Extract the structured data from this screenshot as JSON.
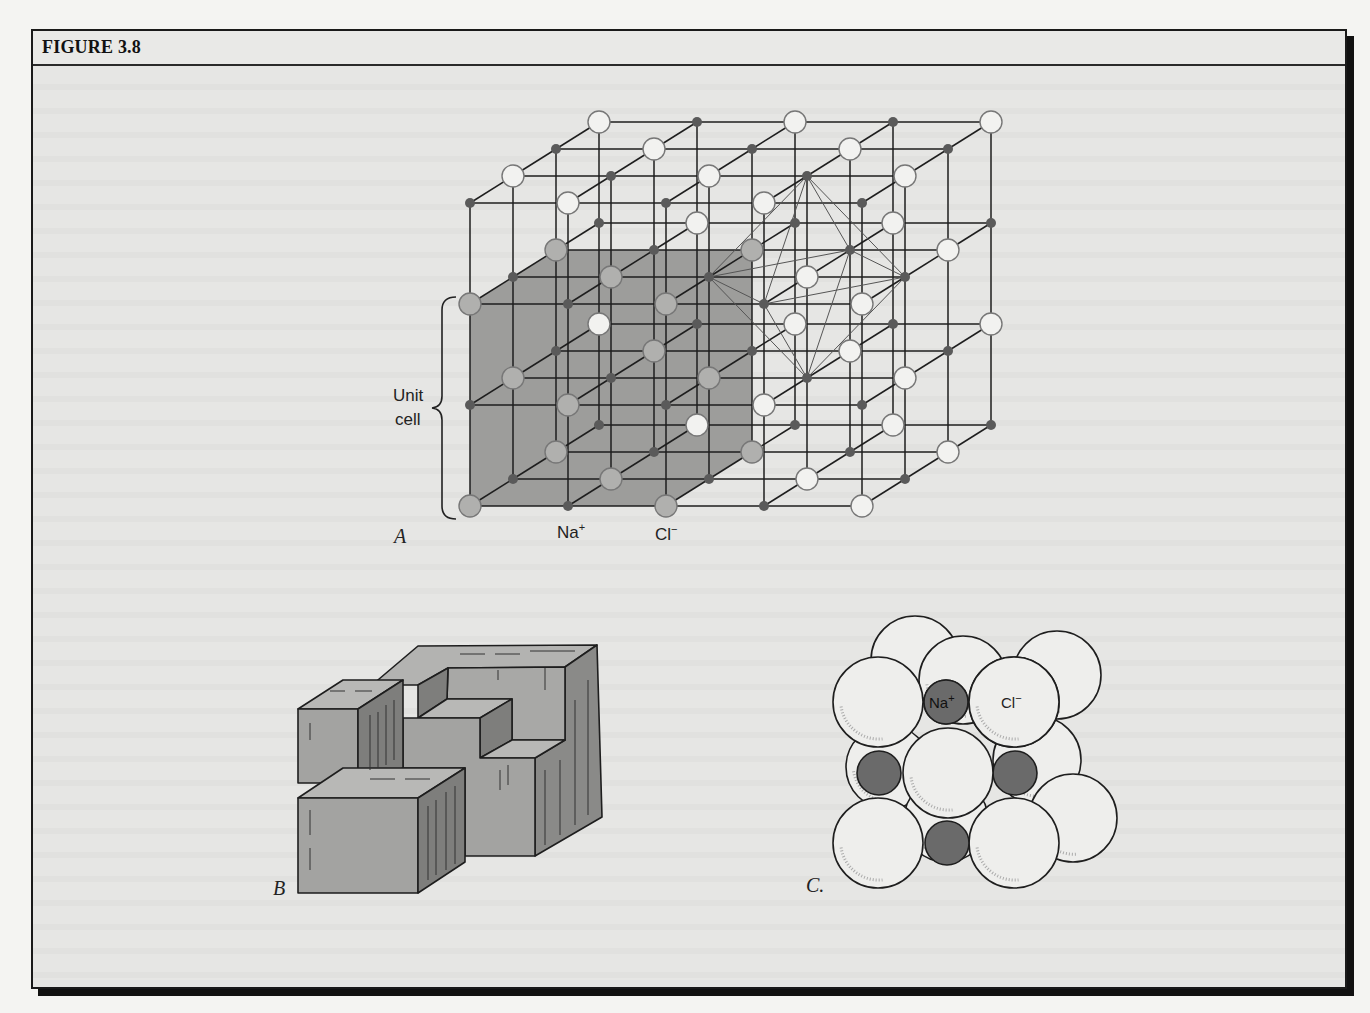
{
  "figure": {
    "title": "FIGURE 3.8"
  },
  "panel_a": {
    "letter": "A",
    "unit_cell_label_line1": "Unit",
    "unit_cell_label_line2": "cell",
    "na_label": "Na",
    "na_charge": "+",
    "cl_label": "Cl",
    "cl_charge": "−",
    "lattice": {
      "origin": [
        470,
        506
      ],
      "dx": [
        98,
        0
      ],
      "dy": [
        0,
        -101
      ],
      "dz": [
        43,
        -27
      ],
      "nx": 5,
      "ny": 4,
      "nz": 4,
      "cl_parity": "even",
      "cl_radius": 11,
      "na_radius": 5,
      "unit_cell_extent": [
        2,
        2,
        2
      ],
      "octahedron_center": [
        3,
        2,
        1
      ]
    },
    "colors": {
      "shade": "#9d9d9b",
      "cl_fill": "#f2f2f0",
      "cl_in_cell_fill": "#b0b0ae",
      "na_fill": "#5a5a5a",
      "line": "#1e1e1e",
      "octa_line": "#555555"
    }
  },
  "panel_b": {
    "letter": "B"
  },
  "panel_c": {
    "letter": "C.",
    "na_label": "Na",
    "na_charge": "+",
    "cl_label": "Cl",
    "cl_charge": "−",
    "back_spheres": [
      [
        915,
        660,
        44
      ],
      [
        963,
        680,
        44
      ],
      [
        1057,
        675,
        44
      ],
      [
        1037,
        760,
        44
      ],
      [
        1073,
        818,
        44
      ],
      [
        888,
        767,
        42
      ],
      [
        946,
        820,
        42
      ]
    ],
    "front_cl": [
      [
        878,
        702,
        45
      ],
      [
        1014,
        702,
        45
      ],
      [
        948,
        773,
        45
      ],
      [
        878,
        843,
        45
      ],
      [
        1014,
        843,
        45
      ]
    ],
    "na": [
      [
        946,
        702,
        22
      ],
      [
        879,
        773,
        22
      ],
      [
        1015,
        773,
        22
      ],
      [
        947,
        843,
        22
      ]
    ],
    "colors": {
      "cl": "#eeeeec",
      "na": "#6a6a6a",
      "edge": "#1e1e1e"
    }
  }
}
